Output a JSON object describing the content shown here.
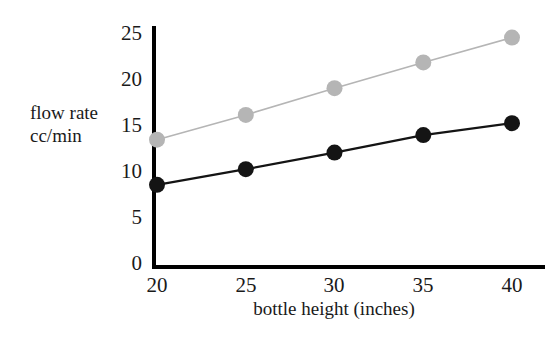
{
  "chart_data": {
    "type": "line",
    "title": "",
    "xlabel": "bottle height (inches)",
    "ylabel": "flow rate cc/min",
    "ylabel_lines": [
      "flow rate",
      "cc/min"
    ],
    "x": [
      20,
      25,
      30,
      35,
      40
    ],
    "xticks": [
      "20",
      "25",
      "30",
      "35",
      "40"
    ],
    "yticks": [
      "0",
      "5",
      "10",
      "15",
      "20",
      "25"
    ],
    "xlim": [
      18.4,
      41.6
    ],
    "ylim": [
      0,
      25
    ],
    "grid": false,
    "legend": "none",
    "series": [
      {
        "name": "upper",
        "color": "#b5b5b5",
        "marker": "circle",
        "values": [
          13.4,
          16.1,
          19.0,
          21.8,
          24.5
        ]
      },
      {
        "name": "lower",
        "color": "#141414",
        "marker": "circle",
        "values": [
          8.5,
          10.2,
          12.0,
          13.9,
          15.2
        ]
      }
    ]
  },
  "axis": {
    "color": "#000000"
  }
}
